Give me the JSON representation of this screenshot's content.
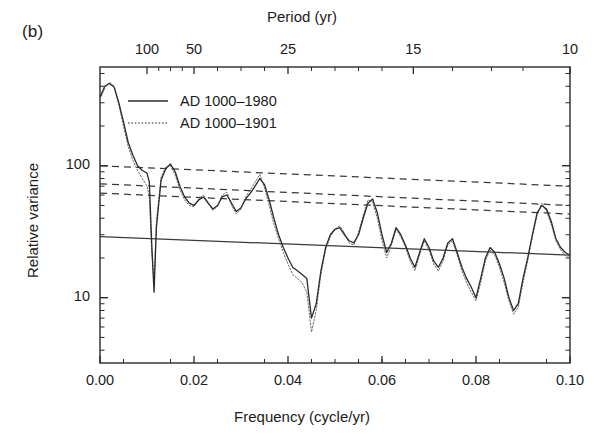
{
  "panel": {
    "label": "(b)"
  },
  "axes": {
    "top": {
      "title": "Period (yr)",
      "ticks": [
        {
          "label": "100",
          "freq": 0.01
        },
        {
          "label": "50",
          "freq": 0.02
        },
        {
          "label": "25",
          "freq": 0.04
        },
        {
          "label": "15",
          "freq": 0.066667
        },
        {
          "label": "10",
          "freq": 0.1
        }
      ],
      "minor_freqs": [
        0.0125,
        0.015,
        0.0175,
        0.025,
        0.03,
        0.035,
        0.045,
        0.05,
        0.055,
        0.06,
        0.075,
        0.0833,
        0.09
      ]
    },
    "bottom": {
      "title": "Frequency (cycle/yr)",
      "ticks": [
        "0.00",
        "0.02",
        "0.04",
        "0.06",
        "0.08",
        "0.10"
      ],
      "range": [
        0.0,
        0.1
      ],
      "minor_step": 0.005
    },
    "left": {
      "title": "Relative variance",
      "ticks": [
        "100",
        "10"
      ],
      "scale": "log",
      "range": [
        3.2,
        560
      ]
    }
  },
  "legend": {
    "position": "top-left-inside",
    "entries": [
      {
        "label": "AD 1000–1980",
        "style": "solid"
      },
      {
        "label": "AD 1000–1901",
        "style": "dotted"
      }
    ]
  },
  "chart_data": {
    "type": "line",
    "title": "",
    "xlabel": "Frequency (cycle/yr)",
    "ylabel": "Relative variance",
    "xlim": [
      0.0,
      0.1
    ],
    "ylim": [
      3.2,
      560
    ],
    "yscale": "log",
    "grid": false,
    "series": [
      {
        "name": "AD 1000–1980",
        "style": "solid",
        "color": "#2b2b2b",
        "x": [
          0.0,
          0.001,
          0.002,
          0.003,
          0.004,
          0.005,
          0.006,
          0.007,
          0.008,
          0.009,
          0.01,
          0.0105,
          0.011,
          0.0115,
          0.012,
          0.013,
          0.014,
          0.015,
          0.016,
          0.017,
          0.018,
          0.019,
          0.02,
          0.021,
          0.022,
          0.023,
          0.024,
          0.025,
          0.026,
          0.027,
          0.028,
          0.029,
          0.03,
          0.031,
          0.032,
          0.033,
          0.034,
          0.035,
          0.036,
          0.037,
          0.038,
          0.039,
          0.04,
          0.041,
          0.042,
          0.043,
          0.044,
          0.045,
          0.046,
          0.047,
          0.048,
          0.049,
          0.05,
          0.051,
          0.052,
          0.053,
          0.054,
          0.055,
          0.056,
          0.057,
          0.058,
          0.059,
          0.06,
          0.061,
          0.062,
          0.063,
          0.064,
          0.065,
          0.066,
          0.067,
          0.068,
          0.069,
          0.07,
          0.071,
          0.072,
          0.073,
          0.074,
          0.075,
          0.076,
          0.077,
          0.078,
          0.079,
          0.08,
          0.081,
          0.082,
          0.083,
          0.084,
          0.085,
          0.086,
          0.087,
          0.088,
          0.089,
          0.09,
          0.091,
          0.092,
          0.093,
          0.094,
          0.095,
          0.096,
          0.097,
          0.098,
          0.099,
          0.1
        ],
        "y": [
          330,
          400,
          420,
          395,
          300,
          215,
          150,
          120,
          100,
          92,
          88,
          75,
          26,
          11,
          34,
          78,
          95,
          103,
          90,
          70,
          58,
          52,
          50,
          55,
          58,
          52,
          47,
          50,
          58,
          60,
          52,
          45,
          48,
          56,
          62,
          70,
          80,
          72,
          55,
          40,
          30,
          24,
          20,
          17,
          16,
          15,
          14,
          7,
          9,
          16,
          24,
          30,
          33,
          34,
          30,
          27,
          26,
          30,
          40,
          52,
          56,
          44,
          30,
          22,
          26,
          34,
          30,
          25,
          20,
          17,
          22,
          28,
          24,
          19,
          17,
          20,
          26,
          28,
          22,
          17,
          14,
          12,
          10,
          14,
          20,
          24,
          22,
          18,
          14,
          10,
          8,
          9,
          14,
          20,
          30,
          44,
          50,
          47,
          38,
          28,
          24,
          22,
          21
        ]
      },
      {
        "name": "AD 1000–1901",
        "style": "dotted",
        "color": "#6a6a6a",
        "x": [
          0.0,
          0.001,
          0.002,
          0.003,
          0.004,
          0.005,
          0.006,
          0.007,
          0.008,
          0.009,
          0.01,
          0.0105,
          0.011,
          0.0115,
          0.012,
          0.013,
          0.014,
          0.015,
          0.016,
          0.017,
          0.018,
          0.019,
          0.02,
          0.021,
          0.022,
          0.023,
          0.024,
          0.025,
          0.026,
          0.027,
          0.028,
          0.029,
          0.03,
          0.031,
          0.032,
          0.033,
          0.034,
          0.035,
          0.036,
          0.037,
          0.038,
          0.039,
          0.04,
          0.041,
          0.042,
          0.043,
          0.044,
          0.045,
          0.046,
          0.047,
          0.048,
          0.049,
          0.05,
          0.051,
          0.052,
          0.053,
          0.054,
          0.055,
          0.056,
          0.057,
          0.058,
          0.059,
          0.06,
          0.061,
          0.062,
          0.063,
          0.064,
          0.065,
          0.066,
          0.067,
          0.068,
          0.069,
          0.07,
          0.071,
          0.072,
          0.073,
          0.074,
          0.075,
          0.076,
          0.077,
          0.078,
          0.079,
          0.08,
          0.081,
          0.082,
          0.083,
          0.084,
          0.085,
          0.086,
          0.087,
          0.088,
          0.089,
          0.09,
          0.091,
          0.092,
          0.093,
          0.094,
          0.095,
          0.096,
          0.097,
          0.098,
          0.099,
          0.1
        ],
        "y": [
          320,
          385,
          430,
          400,
          290,
          200,
          140,
          110,
          92,
          80,
          70,
          58,
          22,
          13,
          38,
          82,
          98,
          100,
          85,
          66,
          55,
          50,
          49,
          56,
          60,
          53,
          46,
          49,
          60,
          63,
          50,
          43,
          47,
          58,
          66,
          75,
          86,
          68,
          50,
          36,
          28,
          22,
          18,
          15,
          14,
          13,
          11,
          5.5,
          8,
          15,
          23,
          29,
          33,
          35,
          31,
          26,
          25,
          31,
          42,
          55,
          53,
          40,
          27,
          20,
          25,
          33,
          29,
          24,
          19,
          16,
          21,
          27,
          23,
          18,
          16,
          19,
          25,
          27,
          21,
          16,
          13,
          11,
          9.5,
          13,
          19,
          23,
          21,
          17,
          13,
          9.5,
          7.5,
          8.5,
          13,
          19,
          29,
          42,
          52,
          45,
          36,
          27,
          23,
          21,
          20
        ]
      }
    ],
    "reference_lines": [
      {
        "name": "confidence-99",
        "style": "dashed",
        "x": [
          0.0,
          0.1
        ],
        "y": [
          100,
          70
        ]
      },
      {
        "name": "confidence-95",
        "style": "dashed",
        "x": [
          0.0,
          0.1
        ],
        "y": [
          73,
          50
        ]
      },
      {
        "name": "confidence-90",
        "style": "dashed",
        "x": [
          0.0,
          0.1
        ],
        "y": [
          62,
          43
        ]
      },
      {
        "name": "red-noise-background",
        "style": "solid",
        "x": [
          0.0,
          0.1
        ],
        "y": [
          29,
          21
        ]
      }
    ]
  }
}
